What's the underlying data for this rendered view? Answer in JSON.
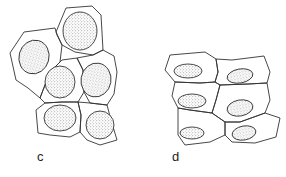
{
  "figure": {
    "panels": [
      {
        "id": "c",
        "label": "c",
        "description": "Polygonal cells with large round stippled nuclei"
      },
      {
        "id": "d",
        "label": "d",
        "description": "Flattened polygonal cells with small oval stippled nuclei"
      }
    ],
    "colors": {
      "outline": "#333333",
      "stipple": "#555555",
      "background": "#ffffff"
    }
  }
}
